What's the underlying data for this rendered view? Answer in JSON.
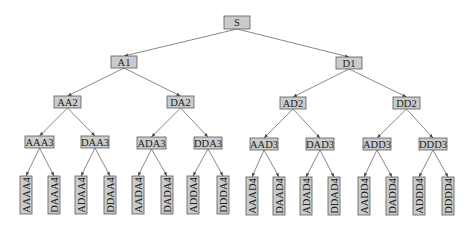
{
  "diagram": {
    "type": "binary-tree",
    "root": "S",
    "colors": {
      "node_fill": "#cbcbcb",
      "node_stroke": "#5a5a5a",
      "edge": "#555555",
      "text": "#222222",
      "background": "#ffffff"
    },
    "nodes": [
      {
        "id": "S",
        "label": "S",
        "x": 224,
        "y": 16,
        "w": 26,
        "h": 13,
        "rot": false
      },
      {
        "id": "A1",
        "label": "A1",
        "x": 111,
        "y": 56,
        "w": 26,
        "h": 12,
        "rot": false
      },
      {
        "id": "D1",
        "label": "D1",
        "x": 336,
        "y": 57,
        "w": 26,
        "h": 12,
        "rot": false
      },
      {
        "id": "AA2",
        "label": "AA2",
        "x": 54,
        "y": 96,
        "w": 27,
        "h": 12,
        "rot": false
      },
      {
        "id": "DA2",
        "label": "DA2",
        "x": 167,
        "y": 96,
        "w": 27,
        "h": 12,
        "rot": false
      },
      {
        "id": "AD2",
        "label": "AD2",
        "x": 280,
        "y": 97,
        "w": 26,
        "h": 12,
        "rot": false
      },
      {
        "id": "DD2",
        "label": "DD2",
        "x": 393,
        "y": 97,
        "w": 27,
        "h": 12,
        "rot": false
      },
      {
        "id": "AAA3",
        "label": "AAA3",
        "x": 25,
        "y": 136,
        "w": 29,
        "h": 12,
        "rot": false
      },
      {
        "id": "DAA3",
        "label": "DAA3",
        "x": 81,
        "y": 136,
        "w": 28,
        "h": 12,
        "rot": false
      },
      {
        "id": "ADA3",
        "label": "ADA3",
        "x": 137,
        "y": 137,
        "w": 29,
        "h": 12,
        "rot": false
      },
      {
        "id": "DDA3",
        "label": "DDA3",
        "x": 194,
        "y": 137,
        "w": 28,
        "h": 12,
        "rot": false
      },
      {
        "id": "AAD3",
        "label": "AAD3",
        "x": 250,
        "y": 138,
        "w": 28,
        "h": 12,
        "rot": false
      },
      {
        "id": "DAD3",
        "label": "DAD3",
        "x": 306,
        "y": 138,
        "w": 28,
        "h": 12,
        "rot": false
      },
      {
        "id": "ADD3",
        "label": "ADD3",
        "x": 363,
        "y": 138,
        "w": 28,
        "h": 12,
        "rot": false
      },
      {
        "id": "DDD3",
        "label": "DDD3",
        "x": 419,
        "y": 138,
        "w": 28,
        "h": 12,
        "rot": false
      },
      {
        "id": "AAAA4",
        "label": "AAAA4",
        "x": 20,
        "y": 176,
        "w": 12,
        "h": 38,
        "rot": true
      },
      {
        "id": "DAAA4",
        "label": "DAAA4",
        "x": 48,
        "y": 176,
        "w": 12,
        "h": 38,
        "rot": true
      },
      {
        "id": "ADAA4",
        "label": "ADAA4",
        "x": 75,
        "y": 176,
        "w": 12,
        "h": 38,
        "rot": true
      },
      {
        "id": "DDAA4",
        "label": "DDAA4",
        "x": 104,
        "y": 176,
        "w": 12,
        "h": 38,
        "rot": true
      },
      {
        "id": "AADA4",
        "label": "AADA4",
        "x": 132,
        "y": 176,
        "w": 12,
        "h": 38,
        "rot": true
      },
      {
        "id": "DADA4",
        "label": "DADA4",
        "x": 161,
        "y": 176,
        "w": 12,
        "h": 38,
        "rot": true
      },
      {
        "id": "ADDA4",
        "label": "ADDA4",
        "x": 187,
        "y": 176,
        "w": 12,
        "h": 38,
        "rot": true
      },
      {
        "id": "DDDA4",
        "label": "DDDA4",
        "x": 217,
        "y": 176,
        "w": 12,
        "h": 38,
        "rot": true
      },
      {
        "id": "AAAD4",
        "label": "AAAD4",
        "x": 246,
        "y": 177,
        "w": 12,
        "h": 38,
        "rot": true
      },
      {
        "id": "DAAD4",
        "label": "DAAD4",
        "x": 273,
        "y": 177,
        "w": 12,
        "h": 38,
        "rot": true
      },
      {
        "id": "ADAD4",
        "label": "ADAD4",
        "x": 300,
        "y": 177,
        "w": 12,
        "h": 38,
        "rot": true
      },
      {
        "id": "DDAD4",
        "label": "DDAD4",
        "x": 328,
        "y": 177,
        "w": 12,
        "h": 38,
        "rot": true
      },
      {
        "id": "AADD4",
        "label": "AADD4",
        "x": 358,
        "y": 177,
        "w": 12,
        "h": 38,
        "rot": true
      },
      {
        "id": "DADD4",
        "label": "DADD4",
        "x": 386,
        "y": 177,
        "w": 12,
        "h": 38,
        "rot": true
      },
      {
        "id": "ADDD4",
        "label": "ADDD4",
        "x": 413,
        "y": 177,
        "w": 12,
        "h": 38,
        "rot": true
      },
      {
        "id": "DDDD4",
        "label": "DDDD4",
        "x": 442,
        "y": 177,
        "w": 12,
        "h": 38,
        "rot": true
      }
    ],
    "edges": [
      [
        "S",
        "A1"
      ],
      [
        "S",
        "D1"
      ],
      [
        "A1",
        "AA2"
      ],
      [
        "A1",
        "DA2"
      ],
      [
        "D1",
        "AD2"
      ],
      [
        "D1",
        "DD2"
      ],
      [
        "AA2",
        "AAA3"
      ],
      [
        "AA2",
        "DAA3"
      ],
      [
        "DA2",
        "ADA3"
      ],
      [
        "DA2",
        "DDA3"
      ],
      [
        "AD2",
        "AAD3"
      ],
      [
        "AD2",
        "DAD3"
      ],
      [
        "DD2",
        "ADD3"
      ],
      [
        "DD2",
        "DDD3"
      ],
      [
        "AAA3",
        "AAAA4"
      ],
      [
        "AAA3",
        "DAAA4"
      ],
      [
        "DAA3",
        "ADAA4"
      ],
      [
        "DAA3",
        "DDAA4"
      ],
      [
        "ADA3",
        "AADA4"
      ],
      [
        "ADA3",
        "DADA4"
      ],
      [
        "DDA3",
        "ADDA4"
      ],
      [
        "DDA3",
        "DDDA4"
      ],
      [
        "AAD3",
        "AAAD4"
      ],
      [
        "AAD3",
        "DAAD4"
      ],
      [
        "DAD3",
        "ADAD4"
      ],
      [
        "DAD3",
        "DDAD4"
      ],
      [
        "ADD3",
        "AADD4"
      ],
      [
        "ADD3",
        "DADD4"
      ],
      [
        "DDD3",
        "ADDD4"
      ],
      [
        "DDD3",
        "DDDD4"
      ]
    ]
  }
}
